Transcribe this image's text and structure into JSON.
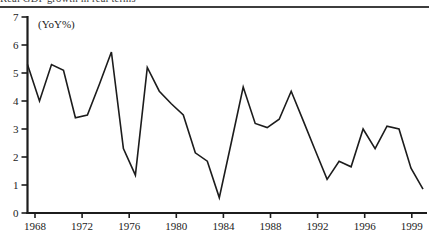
{
  "figure": {
    "caption_clipped": "Real GDP growth in real terms"
  },
  "chart_data": {
    "type": "line",
    "title": "",
    "ylabel": "(YoY%)",
    "xlabel": "",
    "x": [
      1967,
      1968,
      1969,
      1970,
      1971,
      1972,
      1973,
      1974,
      1975,
      1976,
      1977,
      1978,
      1979,
      1980,
      1981,
      1982,
      1983,
      1984,
      1985,
      1986,
      1987,
      1988,
      1989,
      1990,
      1991,
      1992,
      1993,
      1994,
      1995,
      1996,
      1997,
      1998,
      1999,
      2000
    ],
    "series": [
      {
        "name": "Real growth (YoY%)",
        "values": [
          5.3,
          4.0,
          5.3,
          5.1,
          3.4,
          3.5,
          4.6,
          5.75,
          2.3,
          1.35,
          5.2,
          4.35,
          3.9,
          3.5,
          2.15,
          1.85,
          0.55,
          2.5,
          4.5,
          3.2,
          3.05,
          3.35,
          4.35,
          3.3,
          2.25,
          1.2,
          1.85,
          1.65,
          3.0,
          2.3,
          3.1,
          3.0,
          1.6,
          0.85
        ]
      }
    ],
    "x_tick_labels": [
      "1968",
      "1972",
      "1976",
      "1980",
      "1984",
      "1988",
      "1992",
      "1996",
      "1999"
    ],
    "y_tick_labels": [
      "0",
      "1",
      "2",
      "3",
      "4",
      "5",
      "6",
      "7"
    ],
    "ylim": [
      0,
      7
    ],
    "xlim": [
      1967,
      2000
    ],
    "grid": false,
    "legend": "none",
    "colors": {
      "line": "#1c1c1c",
      "axis": "#1c1c1c",
      "text": "#222222",
      "background": "#ffffff",
      "rule": "#3d3d3d"
    }
  }
}
